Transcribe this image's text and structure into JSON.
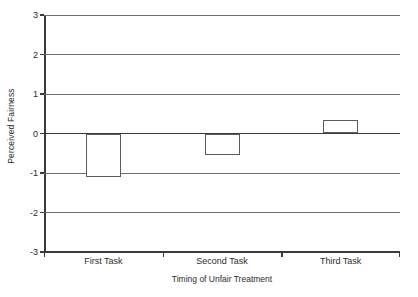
{
  "chart_data": {
    "type": "bar",
    "title": "",
    "xlabel": "Timing of Unfair Treatment",
    "ylabel": "Perceived Fairness",
    "categories": [
      "First Task",
      "Second Task",
      "Third Task"
    ],
    "values": [
      -1.1,
      -0.55,
      0.35
    ],
    "ylim": [
      -3,
      3
    ],
    "yticks": [
      3,
      2,
      1,
      0,
      -1,
      -2,
      -3
    ],
    "ytick_labels": [
      "3",
      "2",
      "1",
      "0",
      "-1",
      "-2",
      "-3"
    ],
    "grid": true,
    "legend": null,
    "series": [
      {
        "name": "Perceived Fairness",
        "values": [
          -1.1,
          -0.55,
          0.35
        ]
      }
    ],
    "colors": {
      "bar_fill": "#ffffff",
      "bar_stroke": "#5c5c5c",
      "gridline": "#6e6e6e",
      "axis": "#3a3a3a",
      "text": "#2b2b2b",
      "background": "#ffffff"
    }
  }
}
